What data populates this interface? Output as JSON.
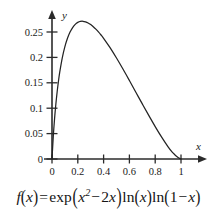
{
  "figure": {
    "caption": "f(x) = exp(x^2 - 2x) ln(x) ln(1-x)",
    "caption_parts": {
      "fn": "f",
      "open1": "(",
      "var1": "x",
      "close1": ")",
      "equals": "=",
      "exp": "exp",
      "open2": "(",
      "var2": "x",
      "power": "2",
      "minus": "−",
      "coeff": "2",
      "var3": "x",
      "close2": ")",
      "ln1": "ln",
      "open3": "(",
      "var4": "x",
      "close3": ")",
      "ln2": "ln",
      "open4": "(",
      "one": "1",
      "minus2": "−",
      "var5": "x",
      "close4": ")"
    }
  },
  "chart_data": {
    "type": "line",
    "title": "",
    "subtitle": "",
    "xlabel": "x",
    "ylabel": "y",
    "xlim": [
      0,
      1.1
    ],
    "ylim": [
      0,
      0.28
    ],
    "grid": false,
    "legend": null,
    "x_ticks": [
      0,
      0.2,
      0.4,
      0.6,
      0.8,
      1
    ],
    "x_tick_labels": [
      "0",
      "0.2",
      "0.4",
      "0.6",
      "0.8",
      "1"
    ],
    "y_ticks": [
      0,
      0.05,
      0.1,
      0.15,
      0.2,
      0.25
    ],
    "y_tick_labels": [
      "0",
      "0.05",
      "0.1",
      "0.15",
      "0.2",
      "0.25"
    ],
    "curve_color": "#232323",
    "axis_color": "#2b2b2b",
    "peak": {
      "x": 0.26,
      "y": 0.262
    },
    "series": [
      {
        "name": "f(x) = exp(x^2 - 2x) ln(x) ln(1-x)",
        "x": [
          0.0,
          0.01,
          0.02,
          0.03,
          0.04,
          0.05,
          0.06,
          0.08,
          0.1,
          0.12,
          0.14,
          0.16,
          0.18,
          0.2,
          0.22,
          0.24,
          0.26,
          0.28,
          0.3,
          0.32,
          0.34,
          0.36,
          0.38,
          0.4,
          0.45,
          0.5,
          0.55,
          0.6,
          0.65,
          0.7,
          0.75,
          0.8,
          0.85,
          0.9,
          0.93,
          0.95,
          0.97,
          0.98,
          0.99,
          0.995,
          1.0
        ],
        "y": [
          0.0,
          0.0447,
          0.0797,
          0.1083,
          0.1324,
          0.153,
          0.1709,
          0.1997,
          0.2213,
          0.2376,
          0.2499,
          0.2588,
          0.265,
          0.2689,
          0.2708,
          0.2711,
          0.27,
          0.2678,
          0.2646,
          0.2605,
          0.2557,
          0.2502,
          0.2441,
          0.2376,
          0.2192,
          0.1988,
          0.1771,
          0.1545,
          0.1315,
          0.1085,
          0.0858,
          0.0638,
          0.043,
          0.0239,
          0.0141,
          0.0089,
          0.0044,
          0.0026,
          0.0011,
          0.00049,
          0.0
        ]
      }
    ]
  },
  "axes": {
    "y_axis_label": "y",
    "x_axis_label": "x"
  }
}
